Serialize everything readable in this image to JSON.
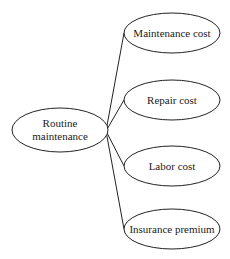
{
  "diagram": {
    "type": "mind-map",
    "root": {
      "line1": "Routine",
      "line2": "maintenance",
      "cx": 60,
      "cy": 130,
      "rx": 48,
      "ry": 22
    },
    "children": [
      {
        "label": "Maintenance cost",
        "cx": 172,
        "cy": 33,
        "rx": 48,
        "ry": 20
      },
      {
        "label": "Repair cost",
        "cx": 172,
        "cy": 100,
        "rx": 48,
        "ry": 20
      },
      {
        "label": "Labor cost",
        "cx": 172,
        "cy": 166,
        "rx": 48,
        "ry": 20
      },
      {
        "label": "Insurance premium",
        "cx": 172,
        "cy": 229,
        "rx": 48,
        "ry": 20
      }
    ],
    "hub": {
      "x": 106,
      "y": 131
    },
    "colors": {
      "stroke": "#222222",
      "text": "#222222",
      "background": "#ffffff"
    }
  }
}
